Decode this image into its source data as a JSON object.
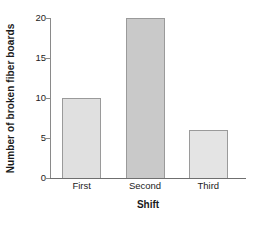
{
  "chart_data": {
    "type": "bar",
    "title": "",
    "subtitle": "",
    "xlabel": "Shift",
    "ylabel": "Number of broken fiber boards",
    "categories": [
      "First",
      "Second",
      "Third"
    ],
    "values": [
      10,
      20,
      6
    ],
    "series": [
      {
        "name": "Number of broken fiber boards",
        "values": [
          10,
          20,
          6
        ]
      }
    ],
    "ylim": [
      0,
      20
    ],
    "yticks": [
      0,
      5,
      10,
      15,
      20
    ],
    "ytick_labels": [
      "0",
      "5",
      "10",
      "15",
      "20"
    ],
    "grid": false,
    "legend": false,
    "legend_position": "none",
    "annotations": [],
    "bar_colors": [
      "#e0e0e0",
      "#c9c9c9",
      "#e4e4e4"
    ],
    "bar_edge_color": "#9a9a9a",
    "axis_color": "#7a7a7a",
    "text_color": "#1a1a1a",
    "background": "#ffffff"
  }
}
